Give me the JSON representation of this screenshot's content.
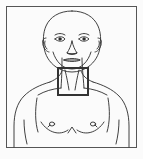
{
  "figure": {
    "title": "Anterior view of male head, neck and upper torso",
    "style": "black line drawing on light background",
    "canvas": {
      "width": 143,
      "height": 159
    },
    "colors": {
      "background": "#fbfbfb",
      "frame_stroke": "#555555",
      "body_stroke": "#2b2b2b",
      "highlight_stroke": "#333333",
      "highlight_fill": "none"
    },
    "frame": {
      "label": "illustration border",
      "x": 6,
      "y": 6,
      "width": 131,
      "height": 142,
      "stroke_width": 1
    },
    "highlight": {
      "label": "neck region highlight box",
      "region_name": "anterior neck / throat",
      "x": 58,
      "y": 68,
      "width": 30,
      "height": 27,
      "stroke_width": 2
    },
    "parts": [
      {
        "name": "cranium",
        "label": "bald scalp / skull outline"
      },
      {
        "name": "forehead",
        "label": "forehead"
      },
      {
        "name": "eyebrow-left",
        "label": "left eyebrow"
      },
      {
        "name": "eyebrow-right",
        "label": "right eyebrow"
      },
      {
        "name": "eye-left",
        "label": "left eye"
      },
      {
        "name": "eye-right",
        "label": "right eye"
      },
      {
        "name": "nose",
        "label": "nose"
      },
      {
        "name": "mouth",
        "label": "mouth"
      },
      {
        "name": "chin",
        "label": "chin and jawline"
      },
      {
        "name": "ear-left",
        "label": "left ear"
      },
      {
        "name": "ear-right",
        "label": "right ear"
      },
      {
        "name": "neck",
        "label": "neck with sternocleidomastoid lines"
      },
      {
        "name": "clavicle-left",
        "label": "left clavicle"
      },
      {
        "name": "clavicle-right",
        "label": "right clavicle"
      },
      {
        "name": "shoulder-left",
        "label": "left shoulder"
      },
      {
        "name": "shoulder-right",
        "label": "right shoulder"
      },
      {
        "name": "arm-left",
        "label": "left upper arm"
      },
      {
        "name": "arm-right",
        "label": "right upper arm"
      },
      {
        "name": "pectoral-left",
        "label": "left pectoral"
      },
      {
        "name": "pectoral-right",
        "label": "right pectoral"
      },
      {
        "name": "nipple-left",
        "label": "left nipple"
      },
      {
        "name": "nipple-right",
        "label": "right nipple"
      },
      {
        "name": "sternum",
        "label": "sternum notch marking"
      }
    ]
  }
}
